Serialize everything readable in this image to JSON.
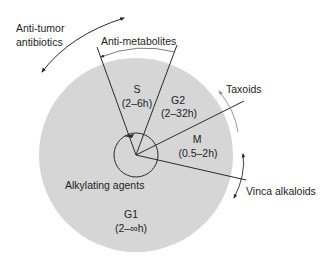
{
  "figure": {
    "type": "cell-cycle-phase-diagram",
    "colors": {
      "background": "#ffffff",
      "cycle_fill": "#d6d6d6",
      "line": "#2a2a2a",
      "faint_arrow": "#9a9a9a"
    }
  },
  "phases": {
    "s": {
      "name": "S",
      "duration": "(2–6h)"
    },
    "g2": {
      "name": "G2",
      "duration": "(2–32h)"
    },
    "m": {
      "name": "M",
      "duration": "(0.5–2h)"
    },
    "g1": {
      "name": "G1",
      "duration": "(2–∞h)"
    }
  },
  "drug_classes": {
    "anti_tumor_line1": "Anti-tumor",
    "anti_tumor_line2": "antibiotics",
    "anti_metabolites": "Anti-metabolites",
    "taxoids": "Taxoids",
    "vinca_alkaloids": "Vinca alkaloids",
    "alkylating_agents": "Alkylating agents"
  }
}
